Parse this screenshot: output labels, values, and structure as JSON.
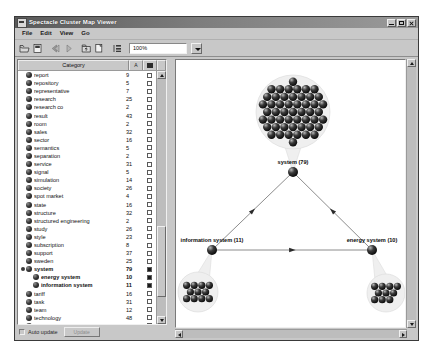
{
  "window": {
    "title": "Spectacle Cluster Map Viewer",
    "icon": "app-icon",
    "buttons": {
      "minimize": "_",
      "maximize": "□",
      "close": "×"
    }
  },
  "menu": {
    "items": [
      "File",
      "Edit",
      "View",
      "Go"
    ]
  },
  "toolbar": {
    "icons": [
      "open-folder-icon",
      "new-page-icon",
      "back-arrow-icon",
      "forward-arrow-icon",
      "folder-up-icon",
      "copy-page-icon",
      "properties-icon"
    ],
    "zoom": {
      "value": "100%",
      "dropdown": "chevron-down-icon"
    }
  },
  "list": {
    "headers": {
      "category": "Category",
      "count": "A",
      "check": "check"
    },
    "rows": [
      {
        "label": "report",
        "count": "9",
        "checked": false,
        "bold": false,
        "child": false
      },
      {
        "label": "repository",
        "count": "5",
        "checked": false,
        "bold": false,
        "child": false
      },
      {
        "label": "representative",
        "count": "7",
        "checked": false,
        "bold": false,
        "child": false
      },
      {
        "label": "research",
        "count": "25",
        "checked": false,
        "bold": false,
        "child": false
      },
      {
        "label": "research co",
        "count": "2",
        "checked": false,
        "bold": false,
        "child": false
      },
      {
        "label": "result",
        "count": "43",
        "checked": false,
        "bold": false,
        "child": false
      },
      {
        "label": "room",
        "count": "2",
        "checked": false,
        "bold": false,
        "child": false
      },
      {
        "label": "sales",
        "count": "32",
        "checked": false,
        "bold": false,
        "child": false
      },
      {
        "label": "sector",
        "count": "16",
        "checked": false,
        "bold": false,
        "child": false
      },
      {
        "label": "semantics",
        "count": "5",
        "checked": false,
        "bold": false,
        "child": false
      },
      {
        "label": "separation",
        "count": "2",
        "checked": false,
        "bold": false,
        "child": false
      },
      {
        "label": "service",
        "count": "31",
        "checked": false,
        "bold": false,
        "child": false
      },
      {
        "label": "signal",
        "count": "5",
        "checked": false,
        "bold": false,
        "child": false
      },
      {
        "label": "simulation",
        "count": "14",
        "checked": false,
        "bold": false,
        "child": false
      },
      {
        "label": "society",
        "count": "26",
        "checked": false,
        "bold": false,
        "child": false
      },
      {
        "label": "spot market",
        "count": "4",
        "checked": false,
        "bold": false,
        "child": false
      },
      {
        "label": "state",
        "count": "16",
        "checked": false,
        "bold": false,
        "child": false
      },
      {
        "label": "structure",
        "count": "32",
        "checked": false,
        "bold": false,
        "child": false
      },
      {
        "label": "structured engineering",
        "count": "2",
        "checked": false,
        "bold": false,
        "child": false
      },
      {
        "label": "study",
        "count": "26",
        "checked": false,
        "bold": false,
        "child": false
      },
      {
        "label": "style",
        "count": "23",
        "checked": false,
        "bold": false,
        "child": false
      },
      {
        "label": "subscription",
        "count": "8",
        "checked": false,
        "bold": false,
        "child": false
      },
      {
        "label": "support",
        "count": "37",
        "checked": false,
        "bold": false,
        "child": false
      },
      {
        "label": "sweden",
        "count": "25",
        "checked": false,
        "bold": false,
        "child": false
      },
      {
        "label": "system",
        "count": "79",
        "checked": true,
        "bold": true,
        "child": false,
        "expanded": true
      },
      {
        "label": "energy system",
        "count": "10",
        "checked": true,
        "bold": true,
        "child": true
      },
      {
        "label": "information system",
        "count": "11",
        "checked": true,
        "bold": true,
        "child": true
      },
      {
        "label": "tariff",
        "count": "16",
        "checked": false,
        "bold": false,
        "child": false
      },
      {
        "label": "task",
        "count": "31",
        "checked": false,
        "bold": false,
        "child": false
      },
      {
        "label": "team",
        "count": "12",
        "checked": false,
        "bold": false,
        "child": false
      },
      {
        "label": "technology",
        "count": "48",
        "checked": false,
        "bold": false,
        "child": false
      },
      {
        "label": "temperature",
        "count": "4",
        "checked": false,
        "bold": false,
        "child": false
      },
      {
        "label": "time",
        "count": "52",
        "checked": false,
        "bold": false,
        "child": false
      },
      {
        "label": "today",
        "count": "9",
        "checked": false,
        "bold": false,
        "child": false
      },
      {
        "label": "traditional load management",
        "count": "1",
        "checked": false,
        "bold": false,
        "child": false
      }
    ]
  },
  "footer": {
    "auto_update_label": "Auto update",
    "update_button": "Update"
  },
  "map": {
    "nodes": [
      {
        "id": "system",
        "label": "system (79)",
        "cluster_size": 79,
        "x": 117,
        "y": 112
      },
      {
        "id": "information-system",
        "label": "information system (11)",
        "cluster_size": 11,
        "x": 36,
        "y": 190
      },
      {
        "id": "energy-system",
        "label": "energy system (10)",
        "cluster_size": 10,
        "x": 196,
        "y": 190
      }
    ],
    "edges": [
      {
        "from": "information-system",
        "to": "system"
      },
      {
        "from": "energy-system",
        "to": "system"
      },
      {
        "from": "information-system",
        "to": "energy-system"
      }
    ]
  },
  "colors": {
    "window_face": "#c8c8c8",
    "title_bar": "#7d7d7d",
    "list_background": "#ffffff",
    "node_fill": "#111111",
    "cluster_halo": "#f0f0f0"
  }
}
